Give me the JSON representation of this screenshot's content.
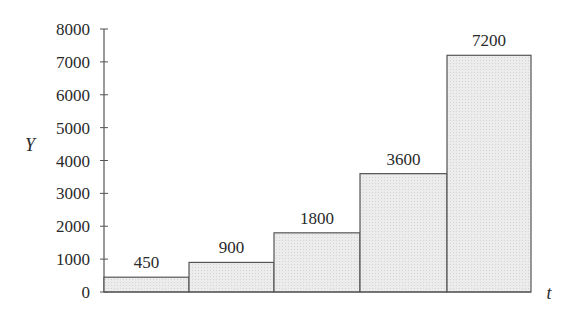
{
  "chart_data": {
    "type": "bar",
    "title": "",
    "xlabel": "t",
    "ylabel": "Y",
    "categories": [
      "1",
      "2",
      "3",
      "4",
      "5"
    ],
    "values": [
      450,
      900,
      1800,
      3600,
      7200
    ],
    "data_labels": [
      "450",
      "900",
      "1800",
      "3600",
      "7200"
    ],
    "ylim": [
      0,
      8000
    ],
    "yticks": [
      0,
      1000,
      2000,
      3000,
      4000,
      5000,
      6000,
      7000,
      8000
    ],
    "ytick_labels": [
      "0",
      "1000",
      "2000",
      "3000",
      "4000",
      "5000",
      "6000",
      "7000",
      "8000"
    ],
    "grid": false,
    "legend": null,
    "bar_style": "adjacent histogram-style bars, light gray fill with dark outline",
    "colors": {
      "bar_fill": "#e6e6e6",
      "bar_stroke": "#555555",
      "axis": "#555555",
      "text": "#2a2a2a"
    }
  }
}
